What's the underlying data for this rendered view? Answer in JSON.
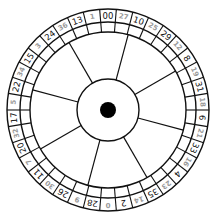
{
  "diagram": {
    "center": {
      "x": 108,
      "y": 110
    },
    "radii": {
      "outer": 101,
      "number_ring_inner": 88,
      "blank_ring_inner": 78,
      "hub": 31,
      "center_dot": 8
    },
    "colors": {
      "line": "#111111",
      "black_number": "#111111",
      "red_number_rendered_gray": "#9a9a9a",
      "background": "#ffffff",
      "center_dot": "#000000"
    },
    "spoke_count": 8,
    "spoke_angles_deg_clockwise_from_top": [
      15,
      60,
      105,
      150,
      195,
      240,
      285,
      330
    ],
    "pockets_clockwise_from_top": [
      {
        "label": "00",
        "color": "black"
      },
      {
        "label": "27",
        "color": "red"
      },
      {
        "label": "10",
        "color": "black"
      },
      {
        "label": "25",
        "color": "red"
      },
      {
        "label": "29",
        "color": "black"
      },
      {
        "label": "12",
        "color": "red"
      },
      {
        "label": "8",
        "color": "black"
      },
      {
        "label": "19",
        "color": "red"
      },
      {
        "label": "31",
        "color": "black"
      },
      {
        "label": "18",
        "color": "red"
      },
      {
        "label": "6",
        "color": "black"
      },
      {
        "label": "21",
        "color": "red"
      },
      {
        "label": "33",
        "color": "black"
      },
      {
        "label": "16",
        "color": "red"
      },
      {
        "label": "4",
        "color": "black"
      },
      {
        "label": "23",
        "color": "red"
      },
      {
        "label": "35",
        "color": "black"
      },
      {
        "label": "14",
        "color": "red"
      },
      {
        "label": "2",
        "color": "black"
      },
      {
        "label": "0",
        "color": "red"
      },
      {
        "label": "28",
        "color": "black"
      },
      {
        "label": "9",
        "color": "red"
      },
      {
        "label": "26",
        "color": "black"
      },
      {
        "label": "30",
        "color": "red"
      },
      {
        "label": "11",
        "color": "black"
      },
      {
        "label": "7",
        "color": "red"
      },
      {
        "label": "20",
        "color": "black"
      },
      {
        "label": "32",
        "color": "red"
      },
      {
        "label": "17",
        "color": "black"
      },
      {
        "label": "5",
        "color": "red"
      },
      {
        "label": "22",
        "color": "black"
      },
      {
        "label": "34",
        "color": "red"
      },
      {
        "label": "15",
        "color": "black"
      },
      {
        "label": "3",
        "color": "red"
      },
      {
        "label": "24",
        "color": "black"
      },
      {
        "label": "36",
        "color": "red"
      },
      {
        "label": "13",
        "color": "black"
      },
      {
        "label": "1",
        "color": "red"
      }
    ]
  }
}
